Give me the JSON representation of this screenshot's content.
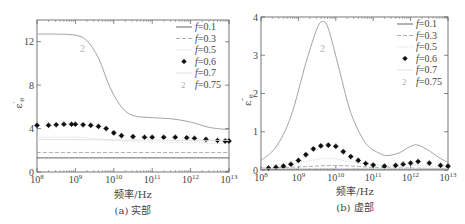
{
  "chart_data": [
    {
      "id": "a",
      "type": "line",
      "caption": "(a) 实部",
      "xlabel": "频率/Hz",
      "ylabel": "ε'e",
      "xscale": "log",
      "xlim": [
        100000000.0,
        10000000000000.0
      ],
      "ylim": [
        0,
        14
      ],
      "xticks": [
        "10^8",
        "10^9",
        "10^10",
        "10^11",
        "10^12",
        "10^13"
      ],
      "yticks": [
        0,
        4,
        8,
        12
      ],
      "legend": [
        "f=0.1",
        "f=0.3",
        "f=0.5",
        "f=0.6",
        "f=0.7",
        "f=0.75"
      ],
      "legend_position": "upper right",
      "series": [
        {
          "name": "f=0.1",
          "style": "solid",
          "x_log10": [
            8,
            13
          ],
          "values": [
            1.3,
            1.3
          ]
        },
        {
          "name": "f=0.3",
          "style": "dashed",
          "x_log10": [
            8,
            13
          ],
          "values": [
            1.8,
            1.8
          ]
        },
        {
          "name": "f=0.5",
          "style": "dotted-light",
          "x_log10": [
            8,
            9,
            9.5,
            10,
            10.5,
            11,
            12,
            13
          ],
          "values": [
            3.2,
            3.2,
            3.1,
            2.9,
            2.8,
            2.75,
            2.7,
            2.6
          ]
        },
        {
          "name": "f=0.6",
          "style": "markers",
          "x_log10": [
            8,
            8.3,
            8.5,
            8.7,
            8.9,
            9.0,
            9.2,
            9.4,
            9.6,
            9.8,
            10.0,
            10.2,
            10.5,
            10.8,
            11.0,
            11.3,
            11.6,
            11.9,
            12.1,
            12.4,
            12.7,
            12.9,
            13.0
          ],
          "values": [
            4.3,
            4.3,
            4.35,
            4.4,
            4.4,
            4.4,
            4.35,
            4.3,
            4.2,
            4.0,
            3.6,
            3.35,
            3.25,
            3.2,
            3.2,
            3.2,
            3.2,
            3.15,
            3.1,
            3.0,
            2.9,
            2.85,
            2.85
          ]
        },
        {
          "name": "f=0.7",
          "style": "light-solid",
          "x_log10": [
            8,
            13
          ],
          "values": [
            3.0,
            2.9
          ]
        },
        {
          "name": "f=0.75",
          "style": "solid-gray",
          "x_log10": [
            8,
            8.5,
            9.0,
            9.3,
            9.6,
            9.9,
            10.2,
            10.5,
            11.0,
            11.5,
            12.0,
            12.5,
            13.0
          ],
          "values": [
            12.7,
            12.7,
            12.6,
            12.1,
            10.5,
            7.8,
            6.0,
            5.2,
            5.0,
            4.9,
            4.6,
            4.1,
            3.9
          ]
        }
      ]
    },
    {
      "id": "b",
      "type": "line",
      "caption": "(b) 虚部",
      "xlabel": "频率/Hz",
      "ylabel": "ε''e",
      "xscale": "log",
      "xlim": [
        100000000.0,
        10000000000000.0
      ],
      "ylim": [
        0,
        4
      ],
      "xticks": [
        "10^8",
        "10^9",
        "10^10",
        "10^11",
        "10^12",
        "10^13"
      ],
      "yticks": [
        0,
        1,
        2,
        3,
        4
      ],
      "legend": [
        "f=0.1",
        "f=0.3",
        "f=0.5",
        "f=0.6",
        "f=0.7",
        "f=0.75"
      ],
      "legend_position": "upper right",
      "series": [
        {
          "name": "f=0.1",
          "style": "solid",
          "x_log10": [
            8,
            13
          ],
          "values": [
            0.02,
            0.02
          ]
        },
        {
          "name": "f=0.3",
          "style": "dashed",
          "x_log10": [
            8,
            9,
            10,
            11,
            12,
            13
          ],
          "values": [
            0.05,
            0.08,
            0.12,
            0.07,
            0.05,
            0.04
          ]
        },
        {
          "name": "f=0.5",
          "style": "dotted-light",
          "x_log10": [
            8,
            9,
            9.8,
            10.5,
            11.5,
            12.2,
            13
          ],
          "values": [
            0.1,
            0.2,
            0.3,
            0.2,
            0.1,
            0.12,
            0.08
          ]
        },
        {
          "name": "f=0.6",
          "style": "markers",
          "x_log10": [
            8.2,
            8.4,
            8.6,
            8.8,
            9.0,
            9.2,
            9.4,
            9.6,
            9.8,
            10.0,
            10.2,
            10.4,
            10.6,
            10.8,
            11.0,
            11.3,
            11.6,
            11.8,
            12.0,
            12.2,
            12.5,
            12.8,
            13.0
          ],
          "values": [
            0.05,
            0.07,
            0.1,
            0.15,
            0.25,
            0.4,
            0.55,
            0.63,
            0.65,
            0.62,
            0.48,
            0.35,
            0.25,
            0.17,
            0.13,
            0.1,
            0.12,
            0.15,
            0.18,
            0.22,
            0.18,
            0.12,
            0.1
          ]
        },
        {
          "name": "f=0.7",
          "style": "light-solid",
          "x_log10": [
            8,
            13
          ],
          "values": [
            0.03,
            0.03
          ]
        },
        {
          "name": "f=0.75",
          "style": "solid-gray",
          "x_log10": [
            8,
            8.4,
            8.8,
            9.2,
            9.5,
            9.65,
            9.8,
            10.1,
            10.4,
            10.8,
            11.2,
            11.4,
            11.7,
            12.0,
            12.2,
            12.5,
            12.8,
            13.0
          ],
          "values": [
            0.25,
            0.6,
            1.4,
            2.8,
            3.7,
            3.88,
            3.7,
            2.6,
            1.5,
            0.7,
            0.42,
            0.38,
            0.45,
            0.62,
            0.65,
            0.5,
            0.3,
            0.2
          ]
        }
      ]
    }
  ],
  "labels": {
    "a": {
      "caption": "(a) 实部",
      "xlabel": "频率/Hz",
      "ylabel": "ε",
      "ylabel_sup": "′",
      "ylabel_sub": "e"
    },
    "b": {
      "caption": "(b) 虚部",
      "xlabel": "频率/Hz",
      "ylabel": "ε",
      "ylabel_sup": "″",
      "ylabel_sub": "e"
    },
    "legend": [
      "f=0.1",
      "f=0.3",
      "f=0.5",
      "f=0.6",
      "f=0.7",
      "f=0.75"
    ],
    "curve_marker": "2"
  },
  "colors": {
    "axis": "#555555",
    "f01": "#555555",
    "f03": "#999999",
    "f05": "#cccccc",
    "f06": "#111111",
    "f07": "#dddddd",
    "f075": "#999999",
    "marker_2": "#b0b0b0"
  }
}
